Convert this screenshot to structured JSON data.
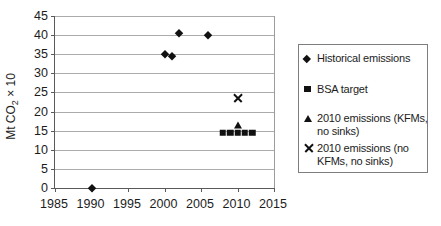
{
  "figure": {
    "background": "#ffffff",
    "text_color": "#1c1c1c",
    "grid_color": "#ababab",
    "axis_color": "#5a5a5a",
    "marker_color": "#111111",
    "legend_border_color": "#7e7e7e"
  },
  "chart_data": {
    "type": "scatter",
    "title": "",
    "xlabel": "",
    "ylabel": "Mt CO2 × 10",
    "ylabel_parts": {
      "prefix": "Mt CO",
      "sub": "2",
      "suffix": " × 10"
    },
    "xlim": [
      1985,
      2015
    ],
    "ylim": [
      0,
      45
    ],
    "x_ticks": [
      1985,
      1990,
      1995,
      2000,
      2005,
      2010,
      2015
    ],
    "y_ticks": [
      0,
      5,
      10,
      15,
      20,
      25,
      30,
      35,
      40,
      45
    ],
    "grid": true,
    "legend_position": "right",
    "series": [
      {
        "name": "Historical emissions",
        "marker": "diamond",
        "label_lines": [
          "Historical emissions"
        ],
        "points": [
          [
            1990,
            0
          ],
          [
            2000,
            35
          ],
          [
            2001,
            34.5
          ],
          [
            2002,
            40.5
          ],
          [
            2006,
            40
          ]
        ]
      },
      {
        "name": "BSA target",
        "marker": "square",
        "label_lines": [
          "BSA target"
        ],
        "points": [
          [
            2008,
            14.5
          ],
          [
            2009,
            14.5
          ],
          [
            2010,
            14.5
          ],
          [
            2011,
            14.5
          ],
          [
            2012,
            14.5
          ]
        ]
      },
      {
        "name": "2010 emissions (KFMs, no sinks)",
        "marker": "triangle",
        "label_lines": [
          "2010 emissions (KFMs,",
          "no sinks)"
        ],
        "points": [
          [
            2010,
            16.5
          ]
        ]
      },
      {
        "name": "2010 emissions (no KFMs, no sinks)",
        "marker": "x",
        "label_lines": [
          "2010 emissions (no",
          "KFMs, no sinks)"
        ],
        "points": [
          [
            2010,
            23.5
          ]
        ]
      }
    ]
  }
}
